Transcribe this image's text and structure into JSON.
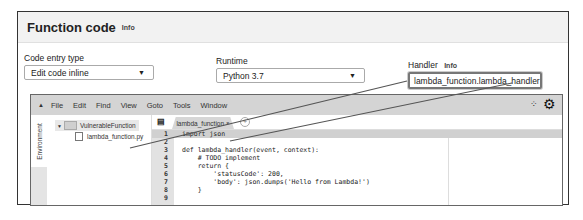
{
  "panel": {
    "title": "Function code",
    "info_link": "Info"
  },
  "code_entry_type": {
    "label": "Code entry type",
    "value": "Edit code inline"
  },
  "runtime": {
    "label": "Runtime",
    "value": "Python 3.7"
  },
  "handler": {
    "label": "Handler",
    "info_link": "Info",
    "value": "lambda_function.lambda_handler"
  },
  "ide": {
    "menu": [
      "File",
      "Edit",
      "Find",
      "View",
      "Goto",
      "Tools",
      "Window"
    ],
    "environment_tab": "Environment",
    "tree": {
      "folder": "VulnerableFunction",
      "file": "lambda_function.py"
    },
    "editor_tab": {
      "label": "lambda_function",
      "close": "×"
    },
    "code_lines": [
      {
        "n": "1",
        "text": "import json"
      },
      {
        "n": "2",
        "text": ""
      },
      {
        "n": "3",
        "text": "def lambda_handler(event, context):"
      },
      {
        "n": "4",
        "text": "    # TODO implement"
      },
      {
        "n": "5",
        "text": "    return {"
      },
      {
        "n": "6",
        "text": "        'statusCode': 200,"
      },
      {
        "n": "7",
        "text": "        'body': json.dumps('Hello from Lambda!')"
      },
      {
        "n": "8",
        "text": "    }"
      },
      {
        "n": "9",
        "text": ""
      }
    ]
  },
  "icons": {
    "collapse": "▲",
    "dropdown": "▼",
    "folder_expand": "▼",
    "fullscreen": "⁘",
    "gear": "⚙",
    "tab_menu": "▤",
    "add_tab": "+"
  }
}
